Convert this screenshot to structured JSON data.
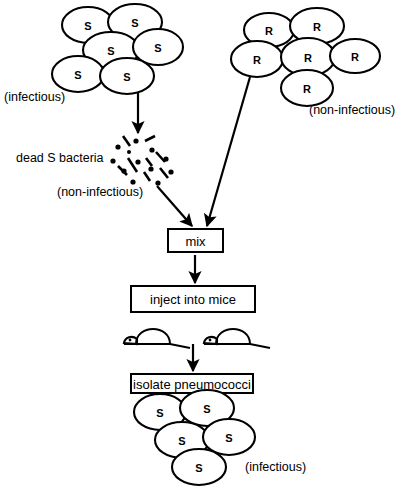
{
  "figure": {
    "background_color": "#ffffff",
    "ink_color": "#000000"
  },
  "clusters": {
    "s_top": {
      "name": "smooth-strain-colony",
      "cell_label": "S",
      "count": 6,
      "caption": "(infectious)",
      "cells": [
        {
          "cx": 88,
          "cy": 25,
          "rx": 26,
          "ry": 18
        },
        {
          "cx": 135,
          "cy": 22,
          "rx": 27,
          "ry": 18
        },
        {
          "cx": 111,
          "cy": 50,
          "rx": 28,
          "ry": 18
        },
        {
          "cx": 158,
          "cy": 47,
          "rx": 25,
          "ry": 18
        },
        {
          "cx": 78,
          "cy": 74,
          "rx": 26,
          "ry": 18
        },
        {
          "cx": 127,
          "cy": 76,
          "rx": 27,
          "ry": 18
        }
      ]
    },
    "r_top": {
      "name": "rough-strain-colony",
      "cell_label": "R",
      "count": 6,
      "caption": "(non-infectious)",
      "cells": [
        {
          "cx": 269,
          "cy": 30,
          "rx": 25,
          "ry": 17
        },
        {
          "cx": 317,
          "cy": 26,
          "rx": 27,
          "ry": 18
        },
        {
          "cx": 257,
          "cy": 59,
          "rx": 26,
          "ry": 18
        },
        {
          "cx": 308,
          "cy": 57,
          "rx": 27,
          "ry": 19
        },
        {
          "cx": 355,
          "cy": 56,
          "rx": 25,
          "ry": 17
        },
        {
          "cx": 307,
          "cy": 88,
          "rx": 26,
          "ry": 18
        }
      ]
    },
    "s_bottom": {
      "name": "recovered-smooth-colony",
      "cell_label": "S",
      "count": 5,
      "caption": "(infectious)",
      "cells": [
        {
          "cx": 160,
          "cy": 412,
          "rx": 26,
          "ry": 18
        },
        {
          "cx": 207,
          "cy": 408,
          "rx": 27,
          "ry": 18
        },
        {
          "cx": 182,
          "cy": 440,
          "rx": 27,
          "ry": 18
        },
        {
          "cx": 229,
          "cy": 437,
          "rx": 26,
          "ry": 18
        },
        {
          "cx": 199,
          "cy": 467,
          "rx": 27,
          "ry": 18
        }
      ]
    }
  },
  "fragments": {
    "name": "heat-killed-debris",
    "label": "dead S bacteria",
    "caption": "(non-infectious)",
    "dots": [
      {
        "cx": 136,
        "cy": 141,
        "r": 2.6
      },
      {
        "cx": 118,
        "cy": 147,
        "r": 2.6
      },
      {
        "cx": 152,
        "cy": 150,
        "r": 2.6
      },
      {
        "cx": 129,
        "cy": 152,
        "r": 2.0
      },
      {
        "cx": 113,
        "cy": 161,
        "r": 2.6
      },
      {
        "cx": 138,
        "cy": 162,
        "r": 2.6
      },
      {
        "cx": 166,
        "cy": 159,
        "r": 2.6
      },
      {
        "cx": 124,
        "cy": 171,
        "r": 2.6
      },
      {
        "cx": 151,
        "cy": 169,
        "r": 2.6
      },
      {
        "cx": 171,
        "cy": 172,
        "r": 2.6
      },
      {
        "cx": 133,
        "cy": 182,
        "r": 2.6
      },
      {
        "cx": 158,
        "cy": 183,
        "r": 2.6
      }
    ],
    "dashes": [
      {
        "x1": 123,
        "y1": 136,
        "x2": 130,
        "y2": 146
      },
      {
        "x1": 145,
        "y1": 141,
        "x2": 155,
        "y2": 136
      },
      {
        "x1": 156,
        "y1": 152,
        "x2": 165,
        "y2": 162
      },
      {
        "x1": 128,
        "y1": 158,
        "x2": 137,
        "y2": 172
      },
      {
        "x1": 146,
        "y1": 158,
        "x2": 152,
        "y2": 166
      },
      {
        "x1": 118,
        "y1": 166,
        "x2": 127,
        "y2": 175
      },
      {
        "x1": 160,
        "y1": 168,
        "x2": 168,
        "y2": 178
      },
      {
        "x1": 144,
        "y1": 172,
        "x2": 150,
        "y2": 181
      }
    ]
  },
  "boxes": [
    {
      "name": "mix-box",
      "label": "mix",
      "x": 168,
      "y": 229,
      "w": 55,
      "h": 23
    },
    {
      "name": "inject-into-mice-box",
      "label": "inject into mice",
      "x": 131,
      "y": 286,
      "w": 124,
      "h": 26
    },
    {
      "name": "isolate-pneumococci-box",
      "label": "isolate pneumococci",
      "x": 131,
      "y": 374,
      "w": 122,
      "h": 19
    }
  ],
  "arrows": [
    {
      "name": "arrow-s-to-debris",
      "x1": 138,
      "y1": 93,
      "x2": 138,
      "y2": 133
    },
    {
      "name": "arrow-debris-to-mix",
      "x1": 157,
      "y1": 186,
      "x2": 192,
      "y2": 226
    },
    {
      "name": "arrow-r-to-mix",
      "x1": 250,
      "y1": 77,
      "x2": 207,
      "y2": 226
    },
    {
      "name": "arrow-mix-to-inject",
      "x1": 195,
      "y1": 255,
      "x2": 195,
      "y2": 283
    },
    {
      "name": "arrow-mice-to-isolate",
      "x1": 193,
      "y1": 344,
      "x2": 193,
      "y2": 371
    }
  ],
  "mice": {
    "name": "injected-mice",
    "count": 2,
    "items": [
      {
        "x": 124,
        "y": 318
      },
      {
        "x": 204,
        "y": 318
      }
    ]
  },
  "labels": {
    "s_top_caption": {
      "text": "(infectious)",
      "x": 4,
      "y": 101
    },
    "debris_label": {
      "text": "dead S bacteria",
      "x": 16,
      "y": 162
    },
    "debris_caption": {
      "text": "(non-infectious)",
      "x": 57,
      "y": 196
    },
    "r_top_caption": {
      "text": "(non-infectious)",
      "x": 309,
      "y": 114
    },
    "s_bottom_caption": {
      "text": "(infectious)",
      "x": 245,
      "y": 471
    }
  }
}
